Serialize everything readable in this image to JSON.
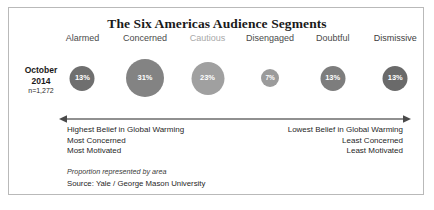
{
  "card": {
    "title": "The Six Americas Audience Segments",
    "border_color": "#b9b9b9"
  },
  "side_label": {
    "month_year_line1": "October",
    "month_year_line2": "2014",
    "sample_size": "n=1,272"
  },
  "chart_data": {
    "type": "bar",
    "title": "The Six Americas Audience Segments",
    "xlabel": "",
    "ylabel": "",
    "categories": [
      "Alarmed",
      "Concerned",
      "Cautious",
      "Disengaged",
      "Doubtful",
      "Dismissive"
    ],
    "values": [
      13,
      31,
      23,
      7,
      13,
      13
    ],
    "value_labels": [
      "13%",
      "31%",
      "23%",
      "7%",
      "13%",
      "13%"
    ],
    "encoding": "Proportion represented by area",
    "bubble_diameters_px": [
      25,
      38,
      33,
      18,
      25,
      25
    ],
    "bubble_colors": [
      "#6f6f6f",
      "#838383",
      "#a0a0a0",
      "#9b9b9b",
      "#7d7d7d",
      "#6a6a6a"
    ],
    "label_colors": [
      "#4a4a4a",
      "#4a4a4a",
      "#a8a8a8",
      "#4a4a4a",
      "#4a4a4a",
      "#3c3c3c"
    ],
    "centers_pct": [
      8,
      25,
      42,
      59,
      76,
      93
    ],
    "grid": false,
    "legend": "none"
  },
  "axis_arrow": {
    "name": "belief-spectrum-arrow",
    "direction": "double-headed",
    "color": "#6b6b6b"
  },
  "extremes": {
    "left": [
      "Highest Belief in Global Warming",
      "Most Concerned",
      "Most Motivated"
    ],
    "right": [
      "Lowest Belief in Global Warming",
      "Least Concerned",
      "Least Motivated"
    ]
  },
  "footer": {
    "note": "Proportion represented by area",
    "source": "Source: Yale / George Mason University"
  }
}
